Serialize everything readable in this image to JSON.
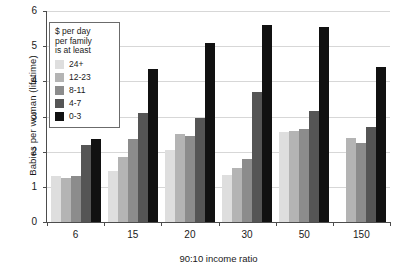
{
  "chart_data": {
    "type": "bar",
    "title": "",
    "xlabel": "90:10 income ratio",
    "ylabel": "Babies per woman (lifetime)",
    "categories": [
      "6",
      "15",
      "20",
      "30",
      "50",
      "150"
    ],
    "ylim": [
      0,
      6
    ],
    "yticks": [
      "0",
      "1",
      "2",
      "3",
      "4",
      "5",
      "6"
    ],
    "grid": true,
    "legend_position": "top-left inside",
    "legend_title": "$ per day\nper family\nis at least",
    "series": [
      {
        "name": "24+",
        "color": "#dedede",
        "values": [
          1.3,
          1.45,
          2.05,
          1.35,
          2.55,
          0.0
        ]
      },
      {
        "name": "12-23",
        "color": "#b4b4b4",
        "values": [
          1.25,
          1.85,
          2.5,
          1.55,
          2.6,
          2.4
        ]
      },
      {
        "name": "8-11",
        "color": "#8c8c8c",
        "values": [
          1.3,
          2.35,
          2.45,
          1.8,
          2.65,
          2.25
        ]
      },
      {
        "name": "4-7",
        "color": "#555555",
        "values": [
          2.2,
          3.1,
          2.95,
          3.7,
          3.15,
          2.7
        ]
      },
      {
        "name": "0-3",
        "color": "#111111",
        "values": [
          2.35,
          4.35,
          5.1,
          5.6,
          5.55,
          4.4
        ]
      }
    ]
  },
  "axes": {
    "y_title": "Babies per woman (lifetime)",
    "x_title": "90:10 income ratio"
  },
  "legend": {
    "title_line1": "$ per day",
    "title_line2": "per family",
    "title_line3": "is at least",
    "items": [
      {
        "label": "24+",
        "color": "#dedede"
      },
      {
        "label": "12-23",
        "color": "#b4b4b4"
      },
      {
        "label": "8-11",
        "color": "#8c8c8c"
      },
      {
        "label": "4-7",
        "color": "#555555"
      },
      {
        "label": "0-3",
        "color": "#111111"
      }
    ]
  }
}
